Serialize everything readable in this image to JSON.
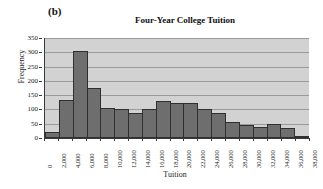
{
  "panel": {
    "label": "(b)"
  },
  "chart_data": {
    "type": "bar",
    "title": "Four-Year College Tuition",
    "xlabel": "Tuition",
    "ylabel": "Frequency",
    "ylim": [
      0,
      350
    ],
    "yticks": [
      0,
      50,
      100,
      150,
      200,
      250,
      300,
      350
    ],
    "ytick_labels": [
      "0",
      "50",
      "100",
      "150",
      "200",
      "250",
      "300",
      "350"
    ],
    "xlim": [
      0,
      38000
    ],
    "xticks": [
      0,
      2000,
      4000,
      6000,
      8000,
      10000,
      12000,
      14000,
      16000,
      18000,
      20000,
      22000,
      24000,
      26000,
      28000,
      30000,
      32000,
      34000,
      36000,
      38000
    ],
    "xtick_labels": [
      "0",
      "2,000",
      "4,000",
      "6,000",
      "8,000",
      "10,000",
      "12,000",
      "14,000",
      "16,000",
      "18,000",
      "20,000",
      "22,000",
      "24,000",
      "26,000",
      "28,000",
      "30,000",
      "32,000",
      "34,000",
      "36,000",
      "38,000"
    ],
    "grid": true,
    "legend": null,
    "bin_width": 2000,
    "categories": [
      "0-2,000",
      "2,000-4,000",
      "4,000-6,000",
      "6,000-8,000",
      "8,000-10,000",
      "10,000-12,000",
      "12,000-14,000",
      "14,000-16,000",
      "16,000-18,000",
      "18,000-20,000",
      "20,000-22,000",
      "22,000-24,000",
      "24,000-26,000",
      "26,000-28,000",
      "28,000-30,000",
      "30,000-32,000",
      "32,000-34,000",
      "34,000-36,000",
      "36,000-38,000"
    ],
    "values": [
      20,
      132,
      306,
      176,
      105,
      102,
      88,
      101,
      130,
      121,
      121,
      101,
      88,
      57,
      47,
      40,
      49,
      35,
      6
    ],
    "bar_color": "#6e6e6e",
    "bar_edge_color": "#2f2f2f",
    "plot_background": "#d2d2d2",
    "gridline_color": "#9a9a9a",
    "axis_color": "#3a3a3a"
  }
}
